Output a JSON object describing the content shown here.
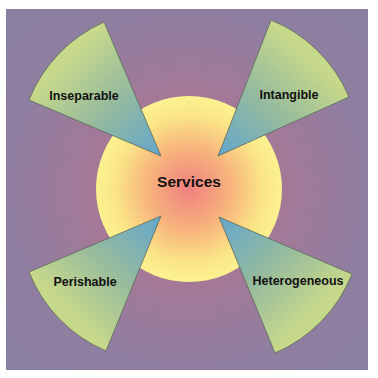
{
  "diagram": {
    "center": {
      "label": "Services"
    },
    "characteristics": [
      {
        "label": "Inseparable",
        "position": "top-left"
      },
      {
        "label": "Intangible",
        "position": "top-right"
      },
      {
        "label": "Perishable",
        "position": "bottom-left"
      },
      {
        "label": "Heterogeneous",
        "position": "bottom-right"
      }
    ],
    "colors": {
      "background": "#9a7a9c",
      "center_fill_inner": "#f08a80",
      "center_fill_outer": "#fbf08c",
      "wedge_tip": "#6aaac8",
      "wedge_outer": "#c4d68a"
    }
  }
}
